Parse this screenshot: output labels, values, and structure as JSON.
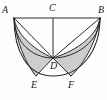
{
  "figure": {
    "stroke_color": "#2b2b2b",
    "fill_color": "#c9c9c9",
    "background_color": "#fefefe",
    "label_color": "#1a1a1a",
    "canvas": {
      "width": 107,
      "height": 100
    },
    "labels": [
      {
        "id": "A",
        "text": "A",
        "x": 2,
        "y": 6,
        "name": "vertex-label-a"
      },
      {
        "id": "C",
        "text": "C",
        "x": 49,
        "y": 4,
        "name": "vertex-label-c"
      },
      {
        "id": "B",
        "text": "B",
        "x": 98,
        "y": 6,
        "name": "vertex-label-b"
      },
      {
        "id": "D",
        "text": "D",
        "x": 50,
        "y": 62,
        "name": "vertex-label-d"
      },
      {
        "id": "E",
        "text": "E",
        "x": 31,
        "y": 80,
        "name": "vertex-label-e"
      },
      {
        "id": "F",
        "text": "F",
        "x": 68,
        "y": 80,
        "name": "vertex-label-f"
      }
    ],
    "points": {
      "A": {
        "x": 14,
        "y": 18
      },
      "C": {
        "x": 53,
        "y": 18
      },
      "B": {
        "x": 100,
        "y": 18
      },
      "D": {
        "x": 53,
        "y": 58
      },
      "E": {
        "x": 36,
        "y": 76
      },
      "F": {
        "x": 71,
        "y": 76
      }
    },
    "segments": [
      {
        "id": "AB",
        "from": "A",
        "to": "B",
        "name": "segment-ab"
      },
      {
        "id": "CD",
        "from": "C",
        "to": "D",
        "name": "segment-cd"
      },
      {
        "id": "AD",
        "from": "A",
        "to": "D",
        "name": "segment-ad"
      },
      {
        "id": "BD",
        "from": "B",
        "to": "D",
        "name": "segment-bd"
      },
      {
        "id": "DE",
        "from": "D",
        "to": "E",
        "name": "segment-de"
      },
      {
        "id": "DF",
        "from": "D",
        "to": "F",
        "name": "segment-df"
      }
    ],
    "arcs": [
      {
        "id": "arc-ADB",
        "desc": "large semicircle on diameter AB through D",
        "name": "arc-semicircle-adb"
      },
      {
        "id": "arc-AEB",
        "desc": "outer arc from A through E and F to B",
        "name": "arc-outer-aefb"
      },
      {
        "id": "arc-ADE",
        "desc": "small arc from A through D to E",
        "name": "arc-small-left"
      },
      {
        "id": "arc-BDF",
        "desc": "small arc from B through D to F",
        "name": "arc-small-right"
      }
    ],
    "shaded_regions": [
      {
        "id": "lune-left",
        "desc": "shaded lune bounded by arc A-D, chord D-E and outer arc E-A",
        "name": "shaded-region-left"
      },
      {
        "id": "lune-right",
        "desc": "shaded lune bounded by arc B-D, chord D-F and outer arc F-B",
        "name": "shaded-region-right"
      }
    ]
  }
}
